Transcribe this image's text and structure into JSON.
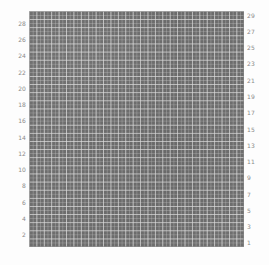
{
  "chart_data": {
    "type": "heatmap",
    "title": "",
    "subtitle": "",
    "xlabel": "",
    "ylabel": "",
    "grid": true,
    "legend": null,
    "legend_position": "none",
    "xlim": [
      0.5,
      29.5
    ],
    "ylim": [
      0.5,
      29.5
    ],
    "rows": 29,
    "cols": 29,
    "cell_color": "#6d6d6d",
    "gridline_color": "#d7d7d7",
    "background_color": "#fdfdfd",
    "tick_label_color": "#8a8a8a",
    "left_axis": {
      "name": "left-tick-labels",
      "ticks": [
        28,
        26,
        24,
        22,
        20,
        18,
        16,
        14,
        12,
        10,
        8,
        6,
        4,
        2
      ]
    },
    "right_axis": {
      "name": "right-tick-labels",
      "ticks": [
        29,
        27,
        25,
        23,
        21,
        19,
        17,
        15,
        13,
        11,
        9,
        7,
        5,
        3,
        1
      ]
    },
    "values": "uniform",
    "note": "All 29x29 cells rendered in a single uniform gray; no per-cell variation is visible."
  }
}
